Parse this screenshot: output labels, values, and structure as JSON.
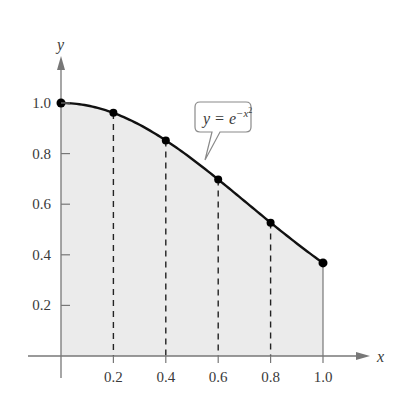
{
  "chart_data": {
    "type": "area",
    "title": "",
    "function_label": {
      "lhs": "y",
      "eq": " = ",
      "base": "e",
      "exponent": "−x",
      "exponent_power": "2"
    },
    "xlabel": "x",
    "ylabel": "y",
    "xlim": [
      0,
      1.1
    ],
    "ylim": [
      0,
      1.15
    ],
    "grid": false,
    "x_ticks": [
      0.2,
      0.4,
      0.6,
      0.8,
      1.0
    ],
    "x_tick_labels": [
      "0.2",
      "0.4",
      "0.6",
      "0.8",
      "1.0"
    ],
    "y_ticks": [
      0.2,
      0.4,
      0.6,
      0.8,
      1.0
    ],
    "y_tick_labels": [
      "0.2",
      "0.4",
      "0.6",
      "0.8",
      "1.0"
    ],
    "points": {
      "x": [
        0,
        0.2,
        0.4,
        0.6,
        0.8,
        1.0
      ],
      "y": [
        1.0,
        0.961,
        0.852,
        0.698,
        0.527,
        0.368
      ]
    },
    "dashed_verticals_at": [
      0.2,
      0.4,
      0.6,
      0.8
    ],
    "shaded_region": {
      "from": 0,
      "to": 1.0,
      "under": "curve"
    },
    "colors": {
      "curve": "#111111",
      "axis": "#777777",
      "fill": "#ebebeb",
      "dash": "#222222",
      "point": "#000000"
    }
  }
}
